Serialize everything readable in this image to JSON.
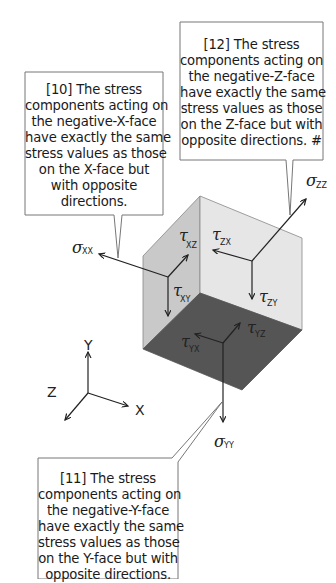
{
  "callouts": {
    "negative_x": {
      "lines": [
        "[10] The stress",
        "components acting on",
        "the negative-X-face",
        "have exactly the same",
        "stress values as those",
        "on the X-face but",
        "with opposite",
        "directions."
      ]
    },
    "negative_z": {
      "lines": [
        "[12] The stress",
        "components acting on",
        "the negative-Z-face",
        "have exactly the same",
        "stress values as those",
        "on the Z-face but with",
        "opposite directions. #"
      ]
    },
    "negative_y": {
      "lines": [
        "[11] The stress",
        "components acting on",
        "the negative-Y-face",
        "have exactly the same",
        "stress values as those",
        "on the Y-face but with",
        "opposite directions."
      ]
    }
  },
  "stress_labels": {
    "sigma_xx": {
      "symbol": "σ",
      "sub": "XX"
    },
    "sigma_yy": {
      "symbol": "σ",
      "sub": "YY"
    },
    "sigma_zz": {
      "symbol": "σ",
      "sub": "ZZ"
    },
    "tau_xz": {
      "symbol": "τ",
      "sub": "XZ"
    },
    "tau_xy": {
      "symbol": "τ",
      "sub": "XY"
    },
    "tau_zx": {
      "symbol": "τ",
      "sub": "ZX"
    },
    "tau_zy": {
      "symbol": "τ",
      "sub": "ZY"
    },
    "tau_yx": {
      "symbol": "τ",
      "sub": "YX"
    },
    "tau_yz": {
      "symbol": "τ",
      "sub": "YZ"
    }
  },
  "axes": {
    "x": "X",
    "y": "Y",
    "z": "Z"
  },
  "colors": {
    "left_face": "#c9c9c9",
    "right_face": "#e6e6e6",
    "bottom_face": "#555555",
    "line": "#222222",
    "callout_border": "#777777"
  }
}
